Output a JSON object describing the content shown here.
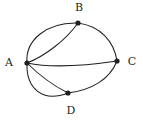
{
  "figure": {
    "kind": "undirected-multigraph",
    "width": 143,
    "height": 123,
    "background_color": "#ffffff",
    "ink_color": "#231f20",
    "node_radius": 2.6,
    "edge_stroke_width": 1.05
  },
  "chart_data": {
    "type": "diagram",
    "title": "",
    "xlabel": "",
    "ylabel": "",
    "graph_type": "undirected multigraph",
    "node_count": 4,
    "edge_count": 7,
    "nodes": [
      {
        "id": "A",
        "label": "A",
        "x": 27,
        "y": 63,
        "label_x": 9,
        "label_y": 63,
        "degree": 5
      },
      {
        "id": "B",
        "label": "B",
        "x": 78,
        "y": 23,
        "label_x": 79,
        "label_y": 8,
        "degree": 3
      },
      {
        "id": "C",
        "label": "C",
        "x": 117,
        "y": 61,
        "label_x": 132,
        "label_y": 62,
        "degree": 3
      },
      {
        "id": "D",
        "label": "D",
        "x": 68,
        "y": 93,
        "label_x": 71,
        "label_y": 111,
        "degree": 3
      }
    ],
    "edges": [
      {
        "id": "AB-outer",
        "source": "A",
        "target": "B",
        "multiplicity_index": 1,
        "path": "M 27 63 C 25 40 47 22 78 23"
      },
      {
        "id": "AB-inner",
        "source": "A",
        "target": "B",
        "multiplicity_index": 2,
        "path": "M 27 63 C 45 56 66 40 78 23"
      },
      {
        "id": "BC",
        "source": "B",
        "target": "C",
        "multiplicity_index": 1,
        "path": "M 78 23 C 100 26 114 41 117 61"
      },
      {
        "id": "AC",
        "source": "A",
        "target": "C",
        "multiplicity_index": 1,
        "path": "M 27 63 C 56 69 90 65 117 61"
      },
      {
        "id": "AD-inner",
        "source": "A",
        "target": "D",
        "multiplicity_index": 1,
        "path": "M 27 63 C 40 76 56 87 68 93"
      },
      {
        "id": "AD-outer",
        "source": "A",
        "target": "D",
        "multiplicity_index": 2,
        "path": "M 27 63 C 26 88 42 103 68 93"
      },
      {
        "id": "DC",
        "source": "D",
        "target": "C",
        "multiplicity_index": 1,
        "path": "M 68 93 C 92 90 110 79 117 61"
      }
    ],
    "adjacency": [
      {
        "pair": "A-B",
        "count": 2
      },
      {
        "pair": "A-C",
        "count": 1
      },
      {
        "pair": "A-D",
        "count": 2
      },
      {
        "pair": "B-C",
        "count": 1
      },
      {
        "pair": "C-D",
        "count": 1
      }
    ],
    "legend": [],
    "annotations": []
  }
}
